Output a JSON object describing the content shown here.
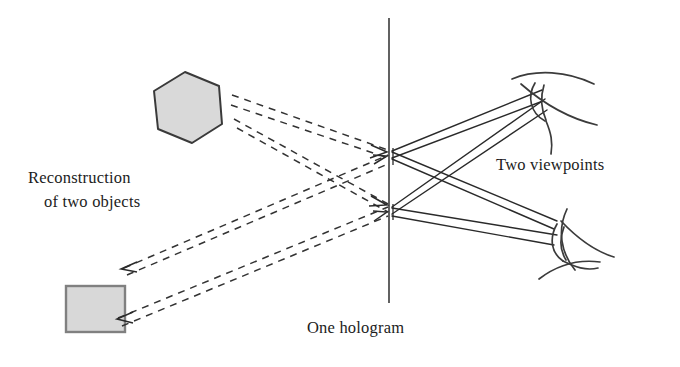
{
  "figure": {
    "labels": {
      "reconstruction_line1": "Reconstruction",
      "reconstruction_line2": "of two objects",
      "two_viewpoints": "Two viewpoints",
      "one_hologram": "One hologram"
    },
    "colors": {
      "background": "#ffffff",
      "stroke": "#1c1c1c",
      "ray_solid": "#2a2a2a",
      "ray_dashed": "#333333",
      "hologram_plane": "#3a3a3a",
      "hexagon_fill": "#d9d9d9",
      "hexagon_stroke": "#3a3a3a",
      "square_fill": "#d8d8d8",
      "square_stroke": "#808080",
      "eye_stroke": "#3b3b3b",
      "text": "#1c1c1c"
    },
    "objects": {
      "hexagon": {
        "name": "reconstructed-hexagon",
        "points": "185,72 219,86 222,124 192,143 158,129 154,91"
      },
      "square": {
        "name": "reconstructed-square",
        "x": 66,
        "y": 286,
        "width": 59,
        "height": 46
      }
    },
    "hologram_plane": {
      "x": 389,
      "y_top": 18,
      "y_bottom": 303
    },
    "nodes": {
      "upper_hologram_point": {
        "x": 392,
        "y": 153
      },
      "lower_hologram_point": {
        "x": 392,
        "y": 211
      },
      "hexagon_exit_upper": {
        "x": 232,
        "y": 95
      },
      "hexagon_exit_lower": {
        "x": 232,
        "y": 122
      },
      "square_exit_upper": {
        "x": 124,
        "y": 268
      },
      "square_exit_lower": {
        "x": 118,
        "y": 318
      },
      "upper_eye_entry_a": {
        "x": 542,
        "y": 92
      },
      "upper_eye_entry_b": {
        "x": 545,
        "y": 110
      },
      "lower_eye_entry_a": {
        "x": 556,
        "y": 222
      },
      "lower_eye_entry_b": {
        "x": 554,
        "y": 243
      }
    },
    "dashed_rays": [
      {
        "name": "dashed-ray-hexagon-to-upper-node-a",
        "d": "M232,95 L388,150"
      },
      {
        "name": "dashed-ray-hexagon-to-upper-node-b",
        "d": "M232,104 L388,157"
      },
      {
        "name": "dashed-ray-hexagon-to-lower-node-a",
        "d": "M234,120 L388,205"
      },
      {
        "name": "dashed-ray-hexagon-to-lower-node-b",
        "d": "M236,128 L388,212"
      },
      {
        "name": "dashed-ray-square-to-upper-node-a",
        "d": "M124,268 L388,156"
      },
      {
        "name": "dashed-ray-square-to-upper-node-b",
        "d": "M126,274 L388,163"
      },
      {
        "name": "dashed-ray-square-to-lower-node-a",
        "d": "M118,318 L388,208"
      },
      {
        "name": "dashed-ray-square-to-lower-node-b",
        "d": "M121,325 L388,215"
      }
    ],
    "solid_rays": [
      {
        "name": "solid-ray-upper-node-to-upper-eye-a",
        "d": "M392,152 L542,92"
      },
      {
        "name": "solid-ray-upper-node-to-upper-eye-b",
        "d": "M392,157 L544,102"
      },
      {
        "name": "solid-ray-upper-node-to-lower-eye-a",
        "d": "M392,152 L556,222"
      },
      {
        "name": "solid-ray-upper-node-to-lower-eye-b",
        "d": "M392,158 L554,228"
      },
      {
        "name": "solid-ray-lower-node-to-upper-eye-a",
        "d": "M392,208 L544,100"
      },
      {
        "name": "solid-ray-lower-node-to-upper-eye-b",
        "d": "M392,214 L546,110"
      },
      {
        "name": "solid-ray-lower-node-to-lower-eye-a",
        "d": "M392,208 L556,236"
      },
      {
        "name": "solid-ray-lower-node-to-lower-eye-b",
        "d": "M392,215 L554,244"
      }
    ],
    "arrowheads": [
      {
        "name": "arrowhead-into-upper-node-from-hexagon",
        "d": "M372,146 L386,153 L371,157"
      },
      {
        "name": "arrowhead-into-lower-node-from-hexagon",
        "d": "M370,196 L386,205 L368,205"
      },
      {
        "name": "arrowhead-into-upper-node-from-square",
        "d": "M374,163 L387,157 L374,156"
      },
      {
        "name": "arrowhead-into-lower-node-from-square",
        "d": "M374,219 L387,212 L374,211"
      },
      {
        "name": "arrowhead-toward-square-upper",
        "d": "M136,263 L121,269 L136,272"
      },
      {
        "name": "arrowhead-toward-square-lower",
        "d": "M132,313 L117,319 L132,322"
      }
    ],
    "eyes": [
      {
        "name": "upper-eye",
        "cornea": "M513,80 C536,70 566,72 592,85",
        "lower_lid": "M520,85 C544,104 570,118 596,124",
        "lens_outer": "M534,84 C527,96 530,112 543,120",
        "lens_inner": "M543,86 C540,98 542,110 545,119",
        "back": "M545,120 C549,132 552,140 550,152"
      },
      {
        "name": "lower-eye",
        "cornea": "M566,212 C558,230 562,252 574,268",
        "lower_lid": "M560,222 C576,239 592,252 612,258",
        "lens_outer": "M556,226 C550,238 552,252 562,260",
        "lens_inner": "M563,228 C559,240 561,252 565,259",
        "back": "M562,260 C574,266 584,270 596,268",
        "lid2": "M540,278 C556,266 576,260 598,262"
      }
    ]
  }
}
